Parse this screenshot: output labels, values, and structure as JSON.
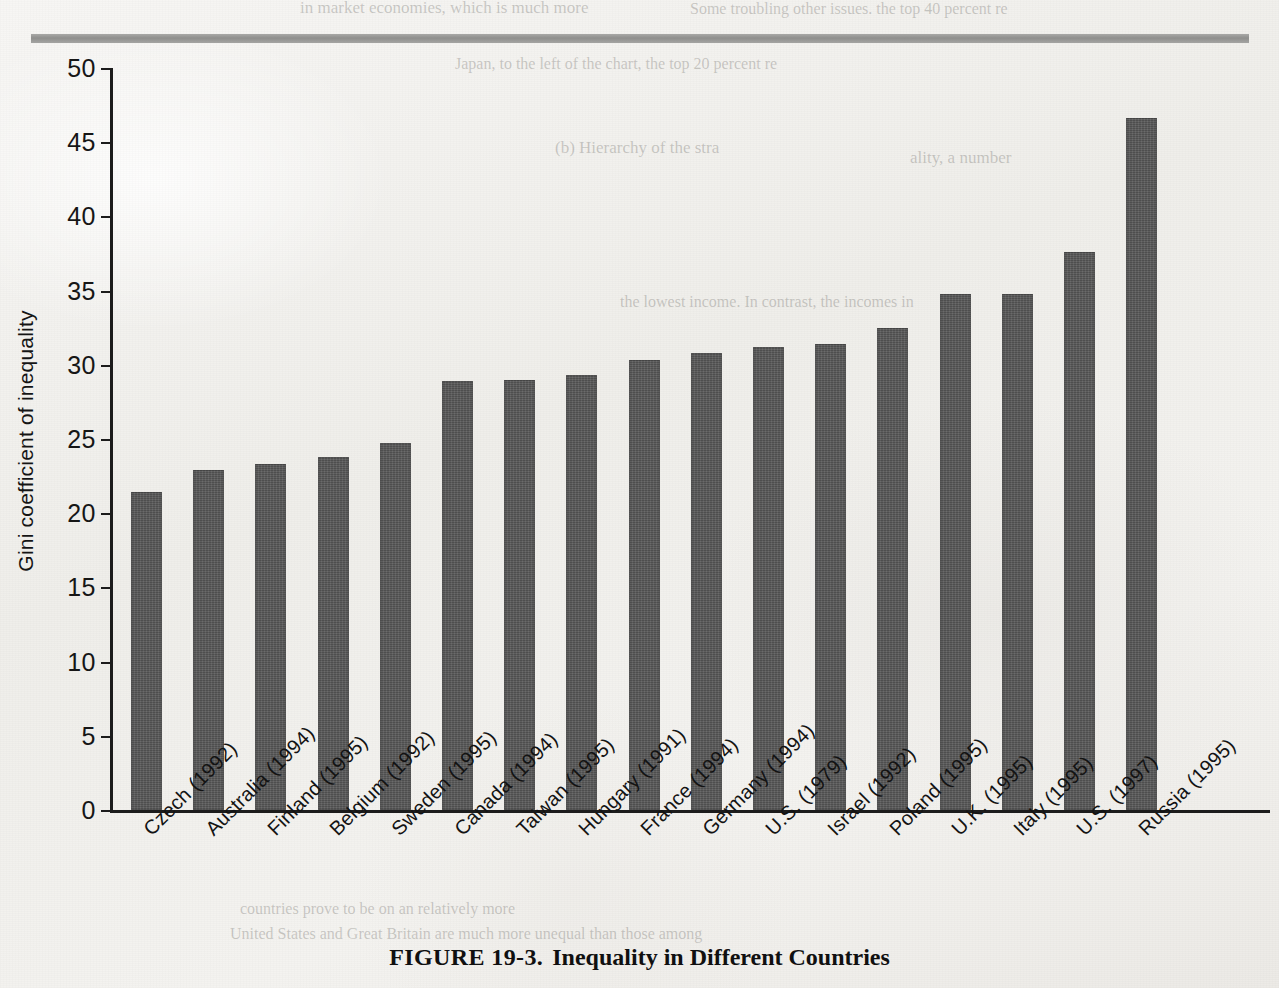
{
  "page": {
    "background_color": "#f1efec",
    "rule_color": "#9a9a98"
  },
  "caption": {
    "figure_number": "FIGURE 19-3.",
    "title": "Inequality in Different Countries"
  },
  "bleed_through": [
    {
      "text": "in market economies, which is much more"
    },
    {
      "text": "Some troubling other issues.  the top 40 percent re"
    },
    {
      "text": "(b) Hierarchy of the stra"
    },
    {
      "text": "ality, a number"
    },
    {
      "text": "Japan, to the left of the chart, the top 20 percent re"
    },
    {
      "text": "the lowest income. In contrast, the incomes in"
    },
    {
      "text": "United States and Great Britain are much more unequal than those among"
    },
    {
      "text": "countries prove to be on an relatively more"
    }
  ],
  "chart_data": {
    "type": "bar",
    "title": "Inequality in Different Countries",
    "xlabel": "",
    "ylabel": "Gini coefficient of inequality",
    "ylim": [
      0,
      50
    ],
    "yticks": [
      0,
      5,
      10,
      15,
      20,
      25,
      30,
      35,
      40,
      45,
      50
    ],
    "grid": false,
    "legend": null,
    "bar_color": "#575757",
    "categories": [
      "Czech (1992)",
      "Australia (1994)",
      "Finland (1995)",
      "Belgium (1992)",
      "Sweden (1995)",
      "Canada (1994)",
      "Taiwan (1995)",
      "Hungary (1991)",
      "France (1994)",
      "Germany (1994)",
      "U.S. (1979)",
      "Israel (1992)",
      "Poland (1995)",
      "U.K. (1995)",
      "Italy (1995)",
      "U.S. (1997)",
      "Russia (1995)"
    ],
    "values": [
      21.4,
      22.9,
      23.3,
      23.8,
      24.7,
      28.9,
      29.0,
      29.3,
      30.3,
      30.8,
      31.2,
      31.4,
      32.5,
      34.8,
      34.8,
      37.6,
      46.6
    ]
  }
}
